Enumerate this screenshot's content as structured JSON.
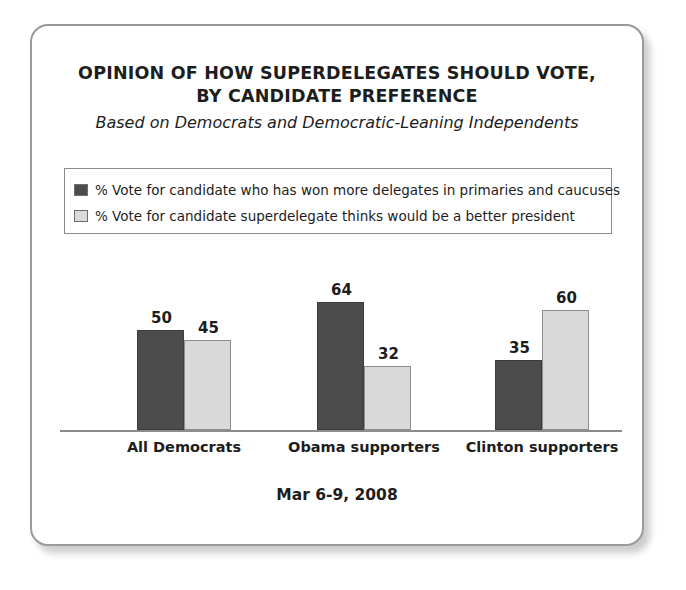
{
  "card": {
    "title_lines": [
      "OPINION OF HOW SUPERDELEGATES SHOULD VOTE,",
      "BY CANDIDATE PREFERENCE"
    ],
    "subtitle": "Based on Democrats and Democratic-Leaning Independents",
    "footer_date": "Mar 6-9, 2008"
  },
  "legend": {
    "items": [
      {
        "swatch": "dark-swatch",
        "color": "#4c4c4c",
        "label": "% Vote for candidate who has won more delegates in primaries and caucuses"
      },
      {
        "swatch": "light-swatch",
        "color": "#d9d9d9",
        "label": "% Vote for candidate superdelegate thinks would be a better president"
      }
    ]
  },
  "chart_data": {
    "type": "bar",
    "title": "OPINION OF HOW SUPERDELEGATES SHOULD VOTE, BY CANDIDATE PREFERENCE",
    "subtitle": "Based on Democrats and Democratic-Leaning Independents",
    "xlabel": "",
    "ylabel": "",
    "ylim": [
      0,
      70
    ],
    "grid": false,
    "legend_position": "top",
    "note": "Mar 6-9, 2008",
    "categories": [
      "All Democrats",
      "Obama supporters",
      "Clinton supporters"
    ],
    "series": [
      {
        "name": "% Vote for candidate who has won more delegates in primaries and caucuses",
        "color": "#4c4c4c",
        "values": [
          50,
          64,
          35
        ]
      },
      {
        "name": "% Vote for candidate superdelegate thinks would be a better president",
        "color": "#d9d9d9",
        "values": [
          45,
          32,
          60
        ]
      }
    ]
  }
}
